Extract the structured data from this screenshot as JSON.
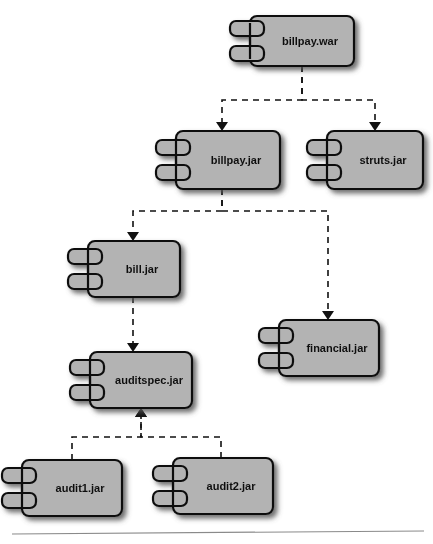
{
  "diagram": {
    "kind": "uml-component-diagram",
    "canvas": {
      "width": 433,
      "height": 544
    },
    "style": {
      "component_fill": "#b3b3b3",
      "component_stroke": "#111111",
      "shadow_color": "#555555",
      "label_color": "#111111",
      "dependency_stroke": "#111111",
      "dependency_dash": "6 5",
      "background": "#ffffff",
      "footer_rule_color": "#8a8a8a"
    },
    "components": [
      {
        "id": "billpay_war",
        "label": "billpay.war",
        "x": 250,
        "y": 16,
        "w": 104,
        "h": 50
      },
      {
        "id": "billpay_jar",
        "label": "billpay.jar",
        "x": 176,
        "y": 131,
        "w": 104,
        "h": 58
      },
      {
        "id": "struts_jar",
        "label": "struts.jar",
        "x": 327,
        "y": 131,
        "w": 96,
        "h": 58
      },
      {
        "id": "bill_jar",
        "label": "bill.jar",
        "x": 88,
        "y": 241,
        "w": 92,
        "h": 56
      },
      {
        "id": "financial_jar",
        "label": "financial.jar",
        "x": 279,
        "y": 320,
        "w": 100,
        "h": 56
      },
      {
        "id": "auditspec_jar",
        "label": "auditspec.jar",
        "x": 90,
        "y": 352,
        "w": 102,
        "h": 56
      },
      {
        "id": "audit1_jar",
        "label": "audit1.jar",
        "x": 22,
        "y": 460,
        "w": 100,
        "h": 56
      },
      {
        "id": "audit2_jar",
        "label": "audit2.jar",
        "x": 173,
        "y": 458,
        "w": 100,
        "h": 56
      }
    ],
    "dependencies": [
      {
        "id": "war_to_billpayjar",
        "from": "billpay.war",
        "to": "billpay.jar",
        "path": "M 302 66 L 302 100 L 222 100 L 222 125",
        "arrow_at": [
          222,
          131
        ],
        "arrow_dir": "down"
      },
      {
        "id": "war_to_struts",
        "from": "billpay.war",
        "to": "struts.jar",
        "path": "M 302 66 L 302 100 L 375 100 L 375 125",
        "arrow_at": [
          375,
          131
        ],
        "arrow_dir": "down"
      },
      {
        "id": "billpayjar_to_billjar",
        "from": "billpay.jar",
        "to": "bill.jar",
        "path": "M 222 189 L 222 211 L 133 211 L 133 235",
        "arrow_at": [
          133,
          241
        ],
        "arrow_dir": "down"
      },
      {
        "id": "billpayjar_to_financial",
        "from": "billpay.jar",
        "to": "financial.jar",
        "path": "M 222 189 L 222 211 L 328 211 L 328 314",
        "arrow_at": [
          328,
          320
        ],
        "arrow_dir": "down"
      },
      {
        "id": "billjar_to_auditspec",
        "from": "bill.jar",
        "to": "auditspec.jar",
        "path": "M 133 297 L 133 346",
        "arrow_at": [
          133,
          352
        ],
        "arrow_dir": "down"
      },
      {
        "id": "audit1_to_auditspec",
        "from": "audit1.jar",
        "to": "auditspec.jar",
        "path": "M 72 460 L 72 437 L 141 437 L 141 414",
        "arrow_at": [
          141,
          408
        ],
        "arrow_dir": "up"
      },
      {
        "id": "audit2_to_auditspec",
        "from": "audit2.jar",
        "to": "auditspec.jar",
        "path": "M 221 458 L 221 437 L 141 437 L 141 414",
        "arrow_at": [
          141,
          408
        ],
        "arrow_dir": "up"
      }
    ],
    "footer_rule": {
      "x1": 12,
      "y1": 534,
      "x2": 424,
      "y2": 531
    }
  }
}
